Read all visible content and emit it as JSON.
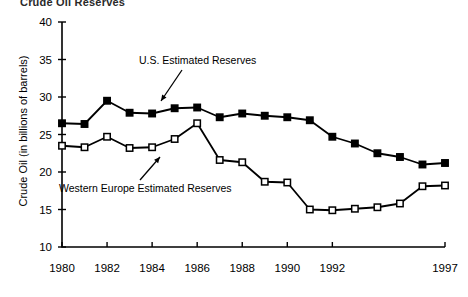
{
  "figure": {
    "clipped_title": "Crude Oil Reserves",
    "background": "#ffffff",
    "ink": "#000000"
  },
  "annotations": {
    "us_label": "U.S. Estimated Reserves",
    "we_label": "Western Europe Estimated Reserves"
  },
  "axes": {
    "ylabel": "Crude Oil (in billions of barrels)",
    "yticks": [
      "40",
      "35",
      "30",
      "25",
      "20",
      "15",
      "10"
    ],
    "xticks": [
      "1980",
      "1982",
      "1984",
      "1986",
      "1988",
      "1990",
      "1992",
      "1997"
    ]
  },
  "chart_data": {
    "type": "line",
    "title": "Crude Oil Reserves",
    "xlabel": "",
    "ylabel": "Crude Oil (in billions of barrels)",
    "xlim": [
      1980,
      1997
    ],
    "ylim": [
      10,
      40
    ],
    "ytick_values": [
      40,
      35,
      30,
      25,
      20,
      15,
      10
    ],
    "xtick_values": [
      1980,
      1982,
      1984,
      1986,
      1988,
      1990,
      1992,
      1997
    ],
    "grid": false,
    "legend": "inline-annotations",
    "x": [
      1980,
      1981,
      1982,
      1983,
      1984,
      1985,
      1986,
      1987,
      1988,
      1989,
      1990,
      1991,
      1992,
      1993,
      1994,
      1995,
      1996,
      1997
    ],
    "series": [
      {
        "name": "U.S. Estimated Reserves",
        "marker": "filled-square",
        "values": [
          26.5,
          26.4,
          29.5,
          27.9,
          27.8,
          28.5,
          28.6,
          27.3,
          27.8,
          27.5,
          27.3,
          26.9,
          24.7,
          23.8,
          22.5,
          22.0,
          21.0,
          21.2
        ]
      },
      {
        "name": "Western Europe Estimated Reserves",
        "marker": "open-square",
        "values": [
          23.5,
          23.3,
          24.7,
          23.2,
          23.3,
          24.4,
          26.5,
          21.6,
          21.3,
          18.7,
          18.6,
          15.0,
          14.9,
          15.1,
          15.3,
          15.8,
          18.1,
          18.2
        ]
      }
    ]
  },
  "geometry": {
    "plot_left": 62,
    "plot_right": 445,
    "plot_top": 22,
    "plot_bottom": 247
  }
}
